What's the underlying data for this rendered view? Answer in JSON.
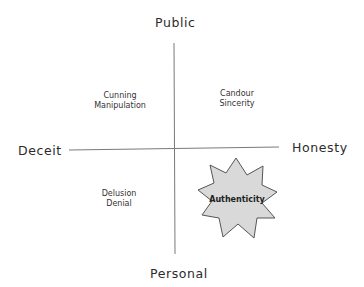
{
  "axes": {
    "top": "Public",
    "bottom": "Personal",
    "left": "Deceit",
    "right": "Honesty"
  },
  "quadrants": {
    "top_left": [
      "Cunning",
      "Manipulation"
    ],
    "top_right": [
      "Candour",
      "Sincerity"
    ],
    "bottom_left": [
      "Delusion",
      "Denial"
    ]
  },
  "highlight": {
    "label": "Authenticity",
    "shape": "9-point star",
    "fill": "#d9d9d9",
    "stroke": "#555555"
  },
  "colors": {
    "line": "#7a7a7a",
    "text": "#2b2b2b",
    "background": "#ffffff"
  }
}
